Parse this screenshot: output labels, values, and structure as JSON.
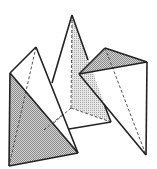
{
  "figure": {
    "colors": {
      "background": "#ffffff",
      "stroke": "#222222",
      "shade_dark": "#9a9a9a",
      "shade_light": "#c8c8c8"
    },
    "shapes": [
      {
        "name": "left-tetrahedron"
      },
      {
        "name": "middle-tetrahedron"
      },
      {
        "name": "right-tetrahedron"
      }
    ]
  }
}
